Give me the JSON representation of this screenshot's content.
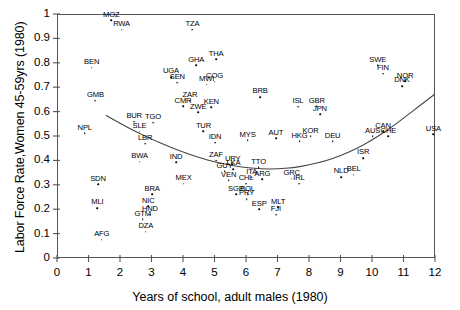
{
  "chart_data": {
    "type": "scatter",
    "title": "",
    "xlabel": "Years of school, adult males (1980)",
    "ylabel": "Labor Force Rate,Women 45-59yrs (1980)",
    "xlim": [
      0,
      12
    ],
    "ylim": [
      0,
      1
    ],
    "xticks": [
      "0",
      "1",
      "2",
      "3",
      "4",
      "5",
      "6",
      "7",
      "8",
      "9",
      "10",
      "11",
      "12"
    ],
    "yticks": [
      "0",
      "0.1",
      "0.2",
      "0.3",
      "0.4",
      "0.5",
      "0.6",
      "0.7",
      "0.8",
      "0.9",
      "1"
    ],
    "grid": false,
    "legend": "none",
    "point_label_field": "iso3",
    "fit_curve": {
      "description": "smooth U-shaped quadratic fit line spanning the plot",
      "points": [
        [
          1.55,
          0.585
        ],
        [
          2.0,
          0.552
        ],
        [
          2.5,
          0.518
        ],
        [
          3.0,
          0.487
        ],
        [
          3.5,
          0.459
        ],
        [
          4.0,
          0.434
        ],
        [
          4.5,
          0.412
        ],
        [
          5.0,
          0.394
        ],
        [
          5.5,
          0.38
        ],
        [
          6.0,
          0.37
        ],
        [
          6.5,
          0.365
        ],
        [
          7.0,
          0.365
        ],
        [
          7.5,
          0.37
        ],
        [
          8.0,
          0.381
        ],
        [
          8.5,
          0.397
        ],
        [
          9.0,
          0.419
        ],
        [
          9.5,
          0.448
        ],
        [
          10.0,
          0.483
        ],
        [
          10.5,
          0.525
        ],
        [
          11.0,
          0.572
        ],
        [
          11.5,
          0.623
        ],
        [
          12.0,
          0.672
        ]
      ]
    },
    "points": [
      {
        "iso3": "MOZ",
        "x": 1.72,
        "y": 0.975
      },
      {
        "iso3": "RWA",
        "x": 2.05,
        "y": 0.935
      },
      {
        "iso3": "TZA",
        "x": 4.3,
        "y": 0.935
      },
      {
        "iso3": "THA",
        "x": 5.05,
        "y": 0.815
      },
      {
        "iso3": "BEN",
        "x": 1.1,
        "y": 0.78
      },
      {
        "iso3": "GHA",
        "x": 4.42,
        "y": 0.79
      },
      {
        "iso3": "SWE",
        "x": 10.18,
        "y": 0.79
      },
      {
        "iso3": "FIN",
        "x": 10.35,
        "y": 0.755
      },
      {
        "iso3": "UGA",
        "x": 3.62,
        "y": 0.742
      },
      {
        "iso3": "SEN",
        "x": 3.82,
        "y": 0.718
      },
      {
        "iso3": "COG",
        "x": 5.0,
        "y": 0.722
      },
      {
        "iso3": "MWI",
        "x": 4.75,
        "y": 0.71
      },
      {
        "iso3": "NOR",
        "x": 11.05,
        "y": 0.725
      },
      {
        "iso3": "DNK",
        "x": 10.95,
        "y": 0.705
      },
      {
        "iso3": "GMB",
        "x": 1.22,
        "y": 0.645
      },
      {
        "iso3": "ZAR",
        "x": 4.22,
        "y": 0.645
      },
      {
        "iso3": "CMR",
        "x": 4.0,
        "y": 0.622
      },
      {
        "iso3": "KEN",
        "x": 4.9,
        "y": 0.618
      },
      {
        "iso3": "BRB",
        "x": 6.45,
        "y": 0.66
      },
      {
        "iso3": "ISL",
        "x": 7.65,
        "y": 0.62
      },
      {
        "iso3": "GBR",
        "x": 8.25,
        "y": 0.622
      },
      {
        "iso3": "ZWE",
        "x": 4.48,
        "y": 0.598
      },
      {
        "iso3": "JPN",
        "x": 8.35,
        "y": 0.59
      },
      {
        "iso3": "BUR",
        "x": 2.45,
        "y": 0.558
      },
      {
        "iso3": "TGO",
        "x": 3.05,
        "y": 0.555
      },
      {
        "iso3": "NPL",
        "x": 0.88,
        "y": 0.512
      },
      {
        "iso3": "SLE",
        "x": 2.62,
        "y": 0.518
      },
      {
        "iso3": "TUR",
        "x": 4.65,
        "y": 0.52
      },
      {
        "iso3": "CAN",
        "x": 10.35,
        "y": 0.52
      },
      {
        "iso3": "AUS",
        "x": 10.02,
        "y": 0.5
      },
      {
        "iso3": "CHE",
        "x": 10.52,
        "y": 0.5
      },
      {
        "iso3": "USA",
        "x": 11.95,
        "y": 0.508
      },
      {
        "iso3": "LBR",
        "x": 2.8,
        "y": 0.468
      },
      {
        "iso3": "IDN",
        "x": 5.02,
        "y": 0.472
      },
      {
        "iso3": "MYS",
        "x": 6.05,
        "y": 0.482
      },
      {
        "iso3": "AUT",
        "x": 6.95,
        "y": 0.49
      },
      {
        "iso3": "KOR",
        "x": 8.05,
        "y": 0.5
      },
      {
        "iso3": "HKG",
        "x": 7.7,
        "y": 0.478
      },
      {
        "iso3": "DEU",
        "x": 8.75,
        "y": 0.478
      },
      {
        "iso3": "BWA",
        "x": 2.62,
        "y": 0.395
      },
      {
        "iso3": "IND",
        "x": 3.78,
        "y": 0.392
      },
      {
        "iso3": "ZAF",
        "x": 5.05,
        "y": 0.398
      },
      {
        "iso3": "ISR",
        "x": 9.72,
        "y": 0.41
      },
      {
        "iso3": "URY",
        "x": 5.58,
        "y": 0.385
      },
      {
        "iso3": "LKA",
        "x": 5.6,
        "y": 0.365
      },
      {
        "iso3": "GUY",
        "x": 5.32,
        "y": 0.355
      },
      {
        "iso3": "TTO",
        "x": 6.4,
        "y": 0.372
      },
      {
        "iso3": "SDN",
        "x": 1.3,
        "y": 0.302
      },
      {
        "iso3": "MEX",
        "x": 4.02,
        "y": 0.305
      },
      {
        "iso3": "VEN",
        "x": 5.45,
        "y": 0.318
      },
      {
        "iso3": "ITA",
        "x": 6.18,
        "y": 0.33
      },
      {
        "iso3": "ARG",
        "x": 6.52,
        "y": 0.322
      },
      {
        "iso3": "GRC",
        "x": 7.45,
        "y": 0.325
      },
      {
        "iso3": "NLD",
        "x": 9.02,
        "y": 0.332
      },
      {
        "iso3": "BEL",
        "x": 9.42,
        "y": 0.342
      },
      {
        "iso3": "IRL",
        "x": 7.68,
        "y": 0.305
      },
      {
        "iso3": "CHL",
        "x": 6.0,
        "y": 0.305
      },
      {
        "iso3": "BRA",
        "x": 3.02,
        "y": 0.262
      },
      {
        "iso3": "SGP",
        "x": 5.68,
        "y": 0.262
      },
      {
        "iso3": "BOL",
        "x": 6.05,
        "y": 0.262
      },
      {
        "iso3": "PRY",
        "x": 6.02,
        "y": 0.242
      },
      {
        "iso3": "MLI",
        "x": 1.28,
        "y": 0.205
      },
      {
        "iso3": "NIC",
        "x": 2.9,
        "y": 0.212
      },
      {
        "iso3": "HND",
        "x": 2.95,
        "y": 0.178
      },
      {
        "iso3": "GTM",
        "x": 2.72,
        "y": 0.158
      },
      {
        "iso3": "ESP",
        "x": 6.42,
        "y": 0.2
      },
      {
        "iso3": "MLT",
        "x": 7.02,
        "y": 0.208
      },
      {
        "iso3": "FJI",
        "x": 6.95,
        "y": 0.178
      },
      {
        "iso3": "DZA",
        "x": 2.82,
        "y": 0.108
      },
      {
        "iso3": "AFG",
        "x": 1.42,
        "y": 0.075
      }
    ]
  }
}
